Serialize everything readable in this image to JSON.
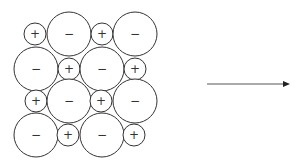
{
  "diagram": {
    "stroke_color": "#333333",
    "background": "#ffffff",
    "ions": [
      {
        "row": 0,
        "col": 0,
        "sign": "+",
        "cx": 35,
        "cy": 34,
        "r": 11
      },
      {
        "row": 0,
        "col": 1,
        "sign": "−",
        "cx": 69,
        "cy": 34,
        "r": 22
      },
      {
        "row": 0,
        "col": 2,
        "sign": "+",
        "cx": 102,
        "cy": 34,
        "r": 11
      },
      {
        "row": 0,
        "col": 3,
        "sign": "−",
        "cx": 135,
        "cy": 34,
        "r": 22
      },
      {
        "row": 1,
        "col": 0,
        "sign": "−",
        "cx": 36,
        "cy": 69,
        "r": 22
      },
      {
        "row": 1,
        "col": 1,
        "sign": "+",
        "cx": 69,
        "cy": 69,
        "r": 11
      },
      {
        "row": 1,
        "col": 2,
        "sign": "−",
        "cx": 102,
        "cy": 69,
        "r": 22
      },
      {
        "row": 1,
        "col": 3,
        "sign": "+",
        "cx": 135,
        "cy": 69,
        "r": 11
      },
      {
        "row": 2,
        "col": 0,
        "sign": "+",
        "cx": 36,
        "cy": 101,
        "r": 11
      },
      {
        "row": 2,
        "col": 1,
        "sign": "−",
        "cx": 69,
        "cy": 101,
        "r": 22
      },
      {
        "row": 2,
        "col": 2,
        "sign": "+",
        "cx": 101,
        "cy": 101,
        "r": 11
      },
      {
        "row": 2,
        "col": 3,
        "sign": "−",
        "cx": 135,
        "cy": 101,
        "r": 22
      },
      {
        "row": 3,
        "col": 0,
        "sign": "−",
        "cx": 36,
        "cy": 135,
        "r": 22
      },
      {
        "row": 3,
        "col": 1,
        "sign": "+",
        "cx": 68,
        "cy": 135,
        "r": 11
      },
      {
        "row": 3,
        "col": 2,
        "sign": "−",
        "cx": 102,
        "cy": 135,
        "r": 22
      },
      {
        "row": 3,
        "col": 3,
        "sign": "+",
        "cx": 134,
        "cy": 135,
        "r": 11
      }
    ],
    "arrow": {
      "x1": 207,
      "y1": 84,
      "x2": 290,
      "y2": 84,
      "color": "#555555"
    }
  }
}
